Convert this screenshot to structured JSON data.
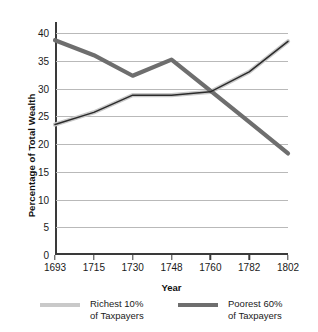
{
  "chart_data": {
    "type": "line",
    "title": "",
    "xlabel": "Year",
    "ylabel": "Percentage of Total Wealth",
    "categories": [
      "1693",
      "1715",
      "1730",
      "1748",
      "1760",
      "1782",
      "1802"
    ],
    "ylim": [
      0,
      40
    ],
    "yticks": [
      0,
      5,
      10,
      15,
      20,
      25,
      30,
      35,
      40
    ],
    "ytick_labels": [
      "0",
      "5",
      "10",
      "15",
      "20",
      "25",
      "30",
      "35",
      "40"
    ],
    "grid": "horizontal",
    "legend_position": "bottom",
    "series": [
      {
        "name": "Richest 10% of Taxpayers",
        "name_line1": "Richest 10%",
        "name_line2": "of Taxpayers",
        "color": "#c9c9c9",
        "outline_color": "#2b2b2b",
        "values": [
          23.5,
          25.7,
          28.8,
          28.8,
          29.4,
          33.0,
          38.5
        ]
      },
      {
        "name": "Poorest 60% of Taxpayers",
        "name_line1": "Poorest 60%",
        "name_line2": "of Taxpayers",
        "color": "#6e6e6e",
        "outline_color": "#6e6e6e",
        "values": [
          38.7,
          36.0,
          32.3,
          35.2,
          29.6,
          24.0,
          18.3
        ]
      }
    ]
  },
  "colors": {
    "axis": "#3a3a3a",
    "grid": "#b9b9b9",
    "background": "#ffffff",
    "text": "#1a1a1a"
  }
}
